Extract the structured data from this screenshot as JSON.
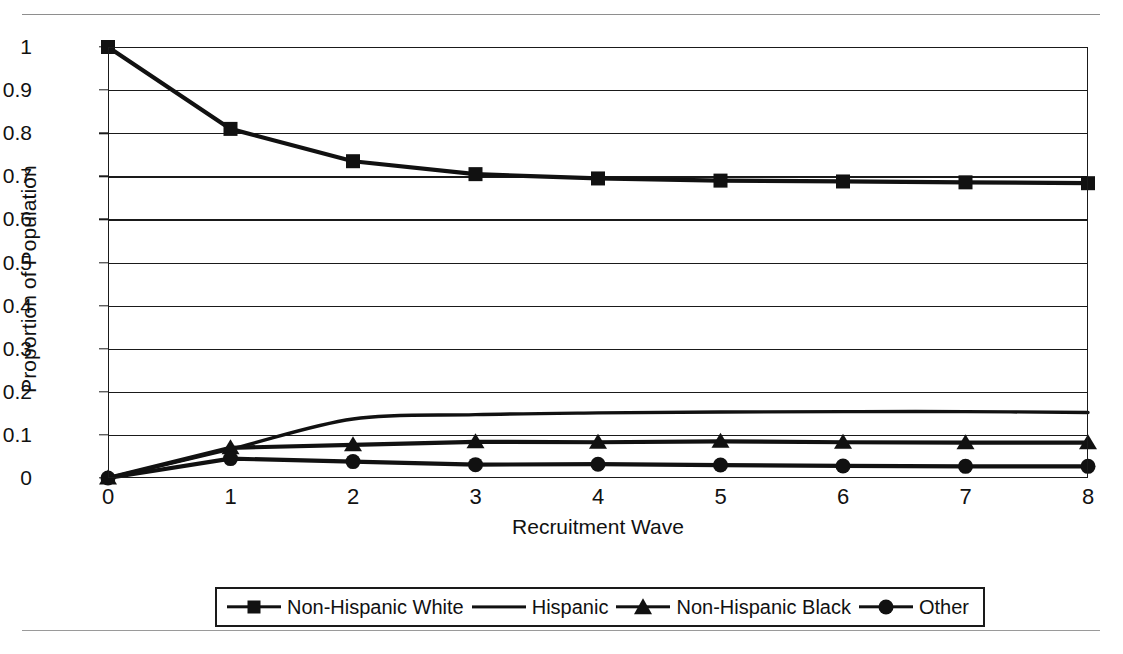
{
  "chart_data": {
    "type": "line",
    "title": "",
    "xlabel": "Recruitment Wave",
    "ylabel": "Proportion of Population",
    "x": [
      0,
      1,
      2,
      3,
      4,
      5,
      6,
      7,
      8
    ],
    "xlim": [
      0,
      8
    ],
    "ylim": [
      0,
      1
    ],
    "xticks": [
      "0",
      "1",
      "2",
      "3",
      "4",
      "5",
      "6",
      "7",
      "8"
    ],
    "yticks": [
      "0",
      "0.1",
      "0.2",
      "0.3",
      "0.4",
      "0.5",
      "0.6",
      "0.7",
      "0.8",
      "0.9",
      "1"
    ],
    "grid": "horizontal",
    "legend_position": "bottom",
    "series": [
      {
        "name": "Non-Hispanic White",
        "marker": "square",
        "color": "#111111",
        "values": [
          1.0,
          0.81,
          0.735,
          0.705,
          0.695,
          0.69,
          0.688,
          0.686,
          0.684
        ]
      },
      {
        "name": "Hispanic",
        "marker": "none",
        "color": "#111111",
        "values": [
          0.0,
          0.067,
          0.137,
          0.147,
          0.151,
          0.153,
          0.154,
          0.154,
          0.152
        ]
      },
      {
        "name": "Non-Hispanic Black",
        "marker": "triangle",
        "color": "#111111",
        "values": [
          0.0,
          0.07,
          0.077,
          0.084,
          0.083,
          0.085,
          0.083,
          0.082,
          0.082
        ]
      },
      {
        "name": "Other",
        "marker": "circle",
        "color": "#111111",
        "values": [
          0.0,
          0.045,
          0.038,
          0.031,
          0.032,
          0.03,
          0.028,
          0.027,
          0.027
        ]
      }
    ]
  },
  "legend": {
    "entries": [
      {
        "label": "Non-Hispanic White",
        "marker": "square"
      },
      {
        "label": "Hispanic",
        "marker": "none"
      },
      {
        "label": "Non-Hispanic Black",
        "marker": "triangle"
      },
      {
        "label": "Other",
        "marker": "circle"
      }
    ]
  }
}
